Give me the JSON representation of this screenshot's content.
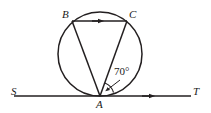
{
  "figure": {
    "type": "geometry-diagram",
    "background_color": "#ffffff",
    "stroke_color": "#231f20",
    "label_color": "#1a1a1a"
  },
  "labels": {
    "point_b": "B",
    "point_c": "C",
    "point_a": "A",
    "point_s": "S",
    "point_t": "T",
    "angle": "70°"
  },
  "geometry": {
    "circle": {
      "cx": 100,
      "cy": 54,
      "r": 42
    },
    "points": {
      "A": {
        "x": 100,
        "y": 96
      },
      "B": {
        "x": 72,
        "y": 21
      },
      "C": {
        "x": 127,
        "y": 21
      },
      "S": {
        "x": 14,
        "y": 96
      },
      "T": {
        "x": 191,
        "y": 96
      }
    },
    "segments": [
      {
        "name": "chord-BC",
        "from": "B",
        "to": "C",
        "marker": "single-arrow-midpoint"
      },
      {
        "name": "chord-AB",
        "from": "A",
        "to": "B",
        "marker": "none"
      },
      {
        "name": "chord-AC",
        "from": "A",
        "to": "C",
        "marker": "none"
      },
      {
        "name": "line-ST",
        "from": "S",
        "to": "T",
        "marker": "single-arrow"
      }
    ],
    "angle_mark": {
      "vertex": "A",
      "between": [
        "chord-AC",
        "line-ST-toward-T"
      ],
      "value_degrees": 70,
      "leader": true
    }
  }
}
